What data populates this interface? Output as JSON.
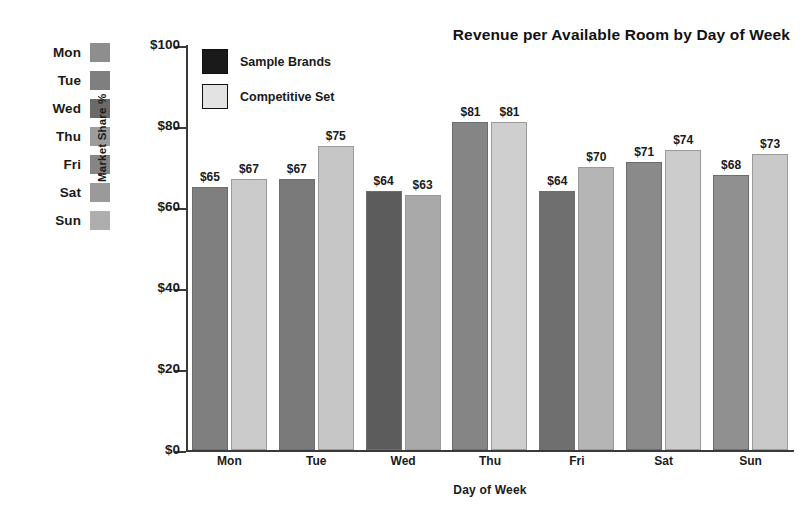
{
  "chart_data": {
    "type": "bar",
    "title": "Revenue per Available Room by Day of Week",
    "xlabel": "Day of Week",
    "ylabel": "Market Share %",
    "categories": [
      "Mon",
      "Tue",
      "Wed",
      "Thu",
      "Fri",
      "Sat",
      "Sun"
    ],
    "series": [
      {
        "name": "Sample Brands",
        "values": [
          65,
          67,
          64,
          81,
          64,
          71,
          68
        ],
        "value_labels": [
          "$65",
          "$67",
          "$64",
          "$81",
          "$64",
          "$71",
          "$68"
        ],
        "color": "#7f7f7f",
        "bar_colors": [
          "#7f7f7f",
          "#7a7a7a",
          "#5c5c5c",
          "#858585",
          "#6f6f6f",
          "#8a8a8a",
          "#909090"
        ],
        "legend_swatch_color": "#1a1a1a"
      },
      {
        "name": "Competitive Set",
        "values": [
          67,
          75,
          63,
          81,
          70,
          74,
          73
        ],
        "value_labels": [
          "$67",
          "$75",
          "$63",
          "$81",
          "$70",
          "$74",
          "$73"
        ],
        "color": "#c9c9c9",
        "bar_colors": [
          "#cbcbcb",
          "#c6c6c6",
          "#a9a9a9",
          "#cfcfcf",
          "#b5b5b5",
          "#cccccc",
          "#c9c9c9"
        ],
        "legend_swatch_color": "#e3e3e3"
      }
    ],
    "ylim": [
      0,
      100
    ],
    "y_ticks": [
      0,
      20,
      40,
      60,
      80,
      100
    ],
    "y_tick_labels": [
      "$0",
      "$20",
      "$40",
      "$60",
      "$80",
      "$100"
    ],
    "grid": false,
    "legend_position": "inside-top-left"
  },
  "day_legend": {
    "items": [
      {
        "label": "Mon",
        "color": "#8e8e8e"
      },
      {
        "label": "Tue",
        "color": "#7f7f7f"
      },
      {
        "label": "Wed",
        "color": "#6a6a6a"
      },
      {
        "label": "Thu",
        "color": "#9c9c9c"
      },
      {
        "label": "Fri",
        "color": "#858585"
      },
      {
        "label": "Sat",
        "color": "#9a9a9a"
      },
      {
        "label": "Sun",
        "color": "#aeaeae"
      }
    ]
  }
}
